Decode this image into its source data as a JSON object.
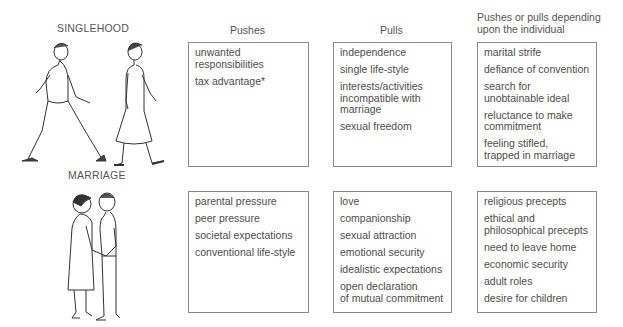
{
  "sections": {
    "singlehood": "SINGLEHOOD",
    "marriage": "MARRIAGE"
  },
  "columns": {
    "pushes": "Pushes",
    "pulls": "Pulls",
    "depending": "Pushes or pulls depending\nupon the individual"
  },
  "singlehood": {
    "pushes": [
      "unwanted\nresponsibilities",
      "tax advantage*"
    ],
    "pulls": [
      "independence",
      "single life-style",
      "interests/activities\nincompatible with\nmarriage",
      "sexual freedom"
    ],
    "depending": [
      "marital strife",
      "defiance of convention",
      "search for\nunobtainable ideal",
      "reluctance to make\ncommitment",
      "feeling stifled,\ntrapped in marriage"
    ]
  },
  "marriage": {
    "pushes": [
      "parental pressure",
      "peer pressure",
      "societal expectations",
      "conventional life-style"
    ],
    "pulls": [
      "love",
      "companionship",
      "sexual attraction",
      "emotional security",
      "idealistic expectations",
      "open declaration\nof mutual commitment"
    ],
    "depending": [
      "religious precepts",
      "ethical and\nphilosophical precepts",
      "need to leave home",
      "economic security",
      "adult roles",
      "desire for children"
    ]
  },
  "illustrations": {
    "singlehood": "two-people-walking-apart",
    "marriage": "couple-holding-hands"
  }
}
